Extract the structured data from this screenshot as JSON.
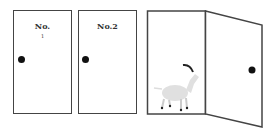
{
  "doors": [
    {
      "label": "No.",
      "sublabel": "1",
      "state": "closed"
    },
    {
      "label": "No.2",
      "state": "closed"
    },
    {
      "label": "",
      "state": "open",
      "contents": "goat"
    }
  ],
  "colors": {
    "outline": "#444444",
    "knob": "#111111",
    "goat": "#e0e0e0",
    "horn": "#222222"
  }
}
